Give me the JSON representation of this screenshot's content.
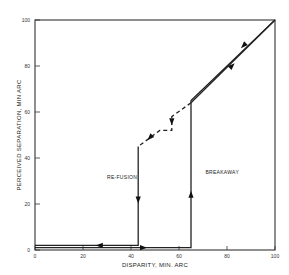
{
  "chart_data": {
    "type": "line",
    "title": "",
    "xlabel": "DISPARITY, MIN. ARC",
    "ylabel": "PERCEIVED SEPARATION, MIN ARC",
    "xlim": [
      0,
      100
    ],
    "ylim": [
      0,
      100
    ],
    "xticks": [
      0,
      20,
      40,
      60,
      80,
      100
    ],
    "yticks": [
      0,
      20,
      40,
      60,
      80,
      100
    ],
    "xtick_labels": [
      "0",
      "20",
      "40",
      "60",
      "80",
      "100"
    ],
    "ytick_labels": [
      "0",
      "20",
      "40",
      "60",
      "80",
      "100"
    ],
    "grid": false,
    "series": [
      {
        "name": "Increasing disparity (breakaway path)",
        "style": "solid",
        "x": [
          0,
          65,
          65,
          100
        ],
        "y": [
          1,
          1,
          65,
          100
        ],
        "arrows": [
          {
            "x": 45,
            "y": 1,
            "direction": "right"
          },
          {
            "x": 65,
            "y": 24,
            "direction": "up"
          },
          {
            "x": 82,
            "y": 80,
            "direction": "up-right"
          }
        ]
      },
      {
        "name": "Decreasing disparity (re-fusion path, solid)",
        "style": "solid",
        "x": [
          100,
          65
        ],
        "y": [
          100,
          64
        ],
        "arrows": [
          {
            "x": 87,
            "y": 89,
            "direction": "down-left"
          }
        ]
      },
      {
        "name": "Decreasing disparity (re-fusion path, dashed)",
        "style": "dashed",
        "x": [
          65,
          57,
          57,
          52,
          43
        ],
        "y": [
          64,
          58,
          52,
          52,
          45
        ],
        "arrows": [
          {
            "x": 57,
            "y": 56,
            "direction": "down"
          },
          {
            "x": 48,
            "y": 49,
            "direction": "down-left"
          }
        ]
      },
      {
        "name": "Decreasing disparity (re-fusion drop)",
        "style": "solid",
        "x": [
          43,
          43,
          0
        ],
        "y": [
          45,
          2,
          2
        ],
        "arrows": [
          {
            "x": 43,
            "y": 22,
            "direction": "down"
          },
          {
            "x": 27,
            "y": 2,
            "direction": "left"
          }
        ]
      }
    ],
    "annotations": [
      {
        "text": "RE-FUSION",
        "x": 30,
        "y": 31
      },
      {
        "text": "BREAKAWAY",
        "x": 71,
        "y": 33
      }
    ]
  }
}
